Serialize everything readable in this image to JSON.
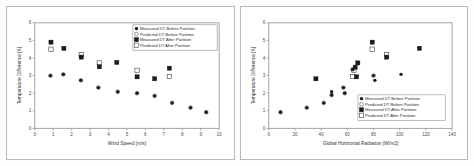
{
  "figure": {
    "background": "#fdfdfd",
    "border_color": "#b9b9b9",
    "panel_count": 2
  },
  "legend": {
    "series_1": "Measured DT Before Partition",
    "series_2": "Predicted DT Before Partition",
    "series_3": "Measured DT After Partition",
    "series_4": "Predicted DT After Partition"
  },
  "chart_data": [
    {
      "id": "left",
      "type": "scatter",
      "title": "",
      "xlabel": "Wind Speed [m/s]",
      "ylabel": "Temperature Difference [K]",
      "xlim": [
        0,
        10
      ],
      "ylim": [
        0,
        6
      ],
      "xticks": [
        0,
        1,
        2,
        3,
        4,
        5,
        6,
        7,
        8,
        9,
        10
      ],
      "yticks": [
        0,
        1,
        2,
        3,
        4,
        5,
        6
      ],
      "grid": false,
      "legend_position": "top-right",
      "series": [
        {
          "name": "Measured DT Before Partition",
          "marker": "filled-dot",
          "points": [
            [
              0.85,
              3.0
            ],
            [
              1.55,
              3.07
            ],
            [
              2.5,
              2.73
            ],
            [
              3.45,
              2.32
            ],
            [
              4.5,
              2.08
            ],
            [
              5.55,
              2.0
            ],
            [
              6.5,
              1.85
            ],
            [
              7.45,
              1.45
            ],
            [
              8.45,
              1.18
            ],
            [
              9.3,
              0.92
            ]
          ]
        },
        {
          "name": "Predicted DT Before Partition",
          "marker": "open-dot",
          "points": [
            [
              0.85,
              3.0
            ],
            [
              1.55,
              3.07
            ],
            [
              2.5,
              2.73
            ],
            [
              3.45,
              2.32
            ],
            [
              4.5,
              2.08
            ],
            [
              5.55,
              2.0
            ],
            [
              6.5,
              1.85
            ],
            [
              7.45,
              1.45
            ],
            [
              8.45,
              1.18
            ],
            [
              9.3,
              0.92
            ]
          ]
        },
        {
          "name": "Measured DT After Partition",
          "marker": "filled-sq",
          "points": [
            [
              0.88,
              4.9
            ],
            [
              1.58,
              4.55
            ],
            [
              2.52,
              4.05
            ],
            [
              3.5,
              3.5
            ],
            [
              4.45,
              3.75
            ],
            [
              5.55,
              2.93
            ],
            [
              6.5,
              2.82
            ],
            [
              7.3,
              3.42
            ]
          ]
        },
        {
          "name": "Predicted DT After Partition",
          "marker": "open-sq",
          "points": [
            [
              0.88,
              4.5
            ],
            [
              2.52,
              4.18
            ],
            [
              3.5,
              3.72
            ],
            [
              5.55,
              3.3
            ],
            [
              7.3,
              2.95
            ]
          ]
        }
      ]
    },
    {
      "id": "right",
      "type": "scatter",
      "title": "",
      "xlabel": "Global Horizontal Radiation [W/m2]",
      "ylabel": "Temperature Difference [K]",
      "xlim": [
        0,
        140
      ],
      "ylim": [
        0,
        6
      ],
      "xticks": [
        0,
        20,
        40,
        60,
        80,
        100,
        120,
        140
      ],
      "yticks": [
        0,
        1,
        2,
        3,
        4,
        5,
        6
      ],
      "grid": false,
      "legend_position": "bottom-right",
      "series": [
        {
          "name": "Measured DT Before Partition",
          "marker": "filled-dot",
          "points": [
            [
              9,
              0.92
            ],
            [
              29,
              1.18
            ],
            [
              36,
              2.8
            ],
            [
              42,
              1.45
            ],
            [
              48,
              1.9
            ],
            [
              48,
              2.08
            ],
            [
              57,
              2.32
            ],
            [
              58,
              2.0
            ],
            [
              64,
              3.35
            ],
            [
              66,
              3.45
            ],
            [
              67,
              2.95
            ],
            [
              68,
              3.7
            ],
            [
              80,
              3.0
            ],
            [
              81,
              2.73
            ],
            [
              101,
              3.07
            ]
          ]
        },
        {
          "name": "Predicted DT Before Partition",
          "marker": "open-dot",
          "points": [
            [
              9,
              0.92
            ],
            [
              29,
              1.18
            ],
            [
              42,
              1.45
            ],
            [
              48,
              1.9
            ],
            [
              57,
              2.32
            ],
            [
              58,
              2.0
            ],
            [
              64,
              3.35
            ],
            [
              80,
              3.0
            ]
          ]
        },
        {
          "name": "Measured DT After Partition",
          "marker": "filled-sq",
          "points": [
            [
              36,
              2.82
            ],
            [
              66,
              3.48
            ],
            [
              67,
              2.93
            ],
            [
              68,
              3.72
            ],
            [
              79,
              4.9
            ],
            [
              90,
              4.05
            ],
            [
              115,
              4.55
            ]
          ]
        },
        {
          "name": "Predicted DT After Partition",
          "marker": "open-sq",
          "points": [
            [
              65,
              3.3
            ],
            [
              64,
              2.95
            ],
            [
              79,
              4.5
            ],
            [
              90,
              4.18
            ]
          ]
        }
      ]
    }
  ]
}
